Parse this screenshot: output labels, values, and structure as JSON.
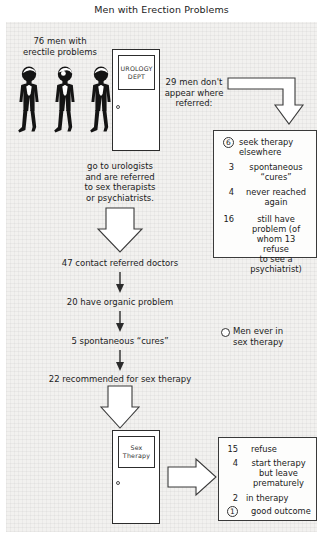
{
  "title": "Men with Erection Problems",
  "labels": {
    "cohort": "76 men with\nerectile problems",
    "no_show": "29 men don't\nappear where\nreferred:",
    "referral_path": "go to urologists\nand are referred\nto sex therapists\nor psychiatrists.",
    "contact": "47 contact referred doctors",
    "organic": "20 have organic problem",
    "spontaneous": "5 spontaneous “cures”",
    "recommended": "22 recommended for sex therapy"
  },
  "doors": {
    "urology": "UROLOGY\nDEPT",
    "sex_therapy": "Sex\nTherapy"
  },
  "legend": {
    "label": "Men ever in\nsex therapy"
  },
  "no_show_outcomes": [
    {
      "count": "6",
      "circled": true,
      "text": "seek therapy\nelsewhere"
    },
    {
      "count": "3",
      "circled": false,
      "text": "spontaneous\n“cures”"
    },
    {
      "count": "4",
      "circled": false,
      "text": "never reached\nagain"
    },
    {
      "count": "16",
      "circled": false,
      "text": "still have\nproblem (of\nwhom 13\nrefuse\nto see a\npsychiatrist)"
    }
  ],
  "therapy_outcomes": [
    {
      "count": "15",
      "circled": false,
      "text": "refuse"
    },
    {
      "count": "4",
      "circled": false,
      "text": "start therapy\nbut leave\nprematurely"
    },
    {
      "count": "2",
      "circled": false,
      "text": "in therapy"
    },
    {
      "count": "1",
      "circled": true,
      "text": "good outcome"
    }
  ],
  "icons": {
    "man": "man-figure-icon",
    "door_knob": "door-knob-icon",
    "legend_circle": "open-circle-icon",
    "arrow_down": "arrow-down-icon",
    "arrow_right": "arrow-right-icon",
    "arrow_curve": "arrow-curved-down-icon"
  },
  "colors": {
    "ink": "#2c2c2c",
    "paper": "#f2f1ef",
    "figure": "#111111"
  }
}
